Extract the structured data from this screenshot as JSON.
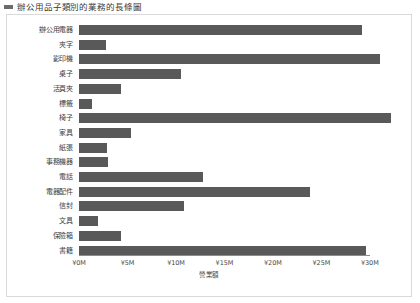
{
  "header": {
    "marker_icon": "legend-square-icon",
    "title": "辦公用品子類別的業務的長條圖"
  },
  "chart_data": {
    "type": "bar",
    "orientation": "horizontal",
    "title": "辦公用品子類別的業務的長條圖",
    "xlabel": "營業額",
    "ylabel": "",
    "categories": [
      "辦公用電器",
      "夾字",
      "影印機",
      "桌子",
      "活頁夾",
      "標籤",
      "椅子",
      "家具",
      "紙張",
      "事務機器",
      "電話",
      "電器配件",
      "信封",
      "文具",
      "保險箱",
      "書籍"
    ],
    "values": [
      29.2,
      2.8,
      31.0,
      10.5,
      4.3,
      1.3,
      32.2,
      5.4,
      2.9,
      3.0,
      12.8,
      23.8,
      10.8,
      2.0,
      4.3,
      29.6
    ],
    "xlim": [
      0,
      32.8
    ],
    "xticks": [
      0,
      5,
      10,
      15,
      20,
      25,
      30
    ],
    "xtick_labels": [
      "¥0M",
      "¥5M",
      "¥10M",
      "¥15M",
      "¥20M",
      "¥25M",
      "¥30M"
    ],
    "bar_color": "#595959",
    "axis_color": "#8c8c8c",
    "grid": false,
    "legend": null,
    "panel_border_color": "#d9d9d9",
    "background": "#ffffff"
  }
}
